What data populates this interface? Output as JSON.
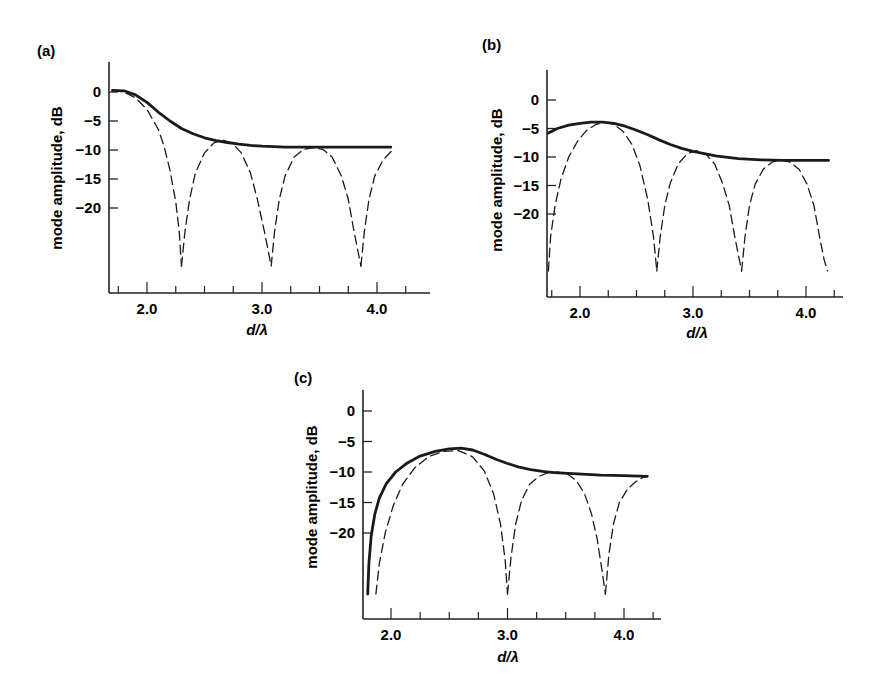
{
  "figure": {
    "panels": [
      {
        "label": "(a)",
        "ylabel": "mode amplitude, dB",
        "xlabel": "d/λ"
      },
      {
        "label": "(b)",
        "ylabel": "mode amplitude, dB",
        "xlabel": "d/λ"
      },
      {
        "label": "(c)",
        "ylabel": "mode amplitude, dB",
        "xlabel": "d/λ"
      }
    ]
  },
  "chart_data": [
    {
      "type": "line",
      "panel": "(a)",
      "title": "(a)",
      "xlabel": "d/λ",
      "ylabel": "mode amplitude, dB",
      "x_ticks": [
        2.0,
        3.0,
        4.0
      ],
      "x_tick_labels": [
        "2.0",
        "3.0",
        "4.0"
      ],
      "x_minor_step": 0.25,
      "y_ticks": [
        0,
        -5,
        -10,
        -15,
        -20
      ],
      "y_tick_labels": [
        "0",
        "-5",
        "-10",
        "-15",
        "-20"
      ],
      "xlim": [
        1.68,
        4.35
      ],
      "ylim": [
        -25,
        5
      ],
      "grid": false,
      "legend": "none",
      "series": [
        {
          "name": "envelope (solid)",
          "style": "solid",
          "x": [
            1.7,
            1.8,
            1.9,
            2.0,
            2.1,
            2.2,
            2.3,
            2.4,
            2.5,
            2.6,
            2.7,
            2.8,
            2.9,
            3.0,
            3.2,
            3.4,
            3.6,
            3.8,
            4.0,
            4.12
          ],
          "y": [
            0.3,
            0.2,
            -0.5,
            -1.8,
            -3.5,
            -5.0,
            -6.3,
            -7.2,
            -7.9,
            -8.4,
            -8.7,
            -9.0,
            -9.2,
            -9.35,
            -9.5,
            -9.5,
            -9.5,
            -9.5,
            -9.5,
            -9.5
          ]
        },
        {
          "name": "mode lobe 1 (dashed)",
          "style": "dashed",
          "x": [
            1.7,
            1.8,
            1.9,
            2.0,
            2.1,
            2.15,
            2.2,
            2.25,
            2.28,
            2.3
          ],
          "y": [
            0.3,
            0.0,
            -1.0,
            -3.0,
            -6.5,
            -9.5,
            -13.5,
            -19.0,
            -24.0,
            -30
          ]
        },
        {
          "name": "mode lobe 2 (dashed)",
          "style": "dashed",
          "x": [
            2.3,
            2.33,
            2.37,
            2.42,
            2.5,
            2.58,
            2.66,
            2.74,
            2.82,
            2.9,
            2.96,
            3.02,
            3.06,
            3.08
          ],
          "y": [
            -30,
            -24.0,
            -18.5,
            -14.0,
            -10.5,
            -8.8,
            -8.3,
            -8.8,
            -10.5,
            -14.0,
            -18.5,
            -24.0,
            -28,
            -30
          ]
        },
        {
          "name": "mode lobe 3 (dashed)",
          "style": "dashed",
          "x": [
            3.08,
            3.11,
            3.15,
            3.2,
            3.28,
            3.36,
            3.45,
            3.53,
            3.61,
            3.69,
            3.75,
            3.8,
            3.84,
            3.86
          ],
          "y": [
            -30,
            -24.0,
            -18.5,
            -14.5,
            -11.2,
            -9.9,
            -9.6,
            -9.9,
            -11.2,
            -14.5,
            -18.5,
            -24.0,
            -28,
            -30
          ]
        },
        {
          "name": "mode lobe 4 (dashed)",
          "style": "dashed",
          "x": [
            3.86,
            3.89,
            3.93,
            3.98,
            4.05,
            4.12,
            4.15
          ],
          "y": [
            -30,
            -24.0,
            -18.5,
            -14.5,
            -11.8,
            -10.3,
            -10.1
          ]
        }
      ]
    },
    {
      "type": "line",
      "panel": "(b)",
      "title": "(b)",
      "xlabel": "d/λ",
      "ylabel": "mode amplitude, dB",
      "x_ticks": [
        2.0,
        3.0,
        4.0
      ],
      "x_tick_labels": [
        "2.0",
        "3.0",
        "4.0"
      ],
      "x_minor_step": 0.25,
      "y_ticks": [
        0,
        -5,
        -10,
        -15,
        -20
      ],
      "y_tick_labels": [
        "0",
        "-5",
        "-10",
        "-15",
        "-20"
      ],
      "xlim": [
        1.72,
        4.35
      ],
      "ylim": [
        -25,
        5
      ],
      "grid": false,
      "legend": "none",
      "series": [
        {
          "name": "envelope (solid)",
          "style": "solid",
          "x": [
            1.72,
            1.8,
            1.9,
            2.0,
            2.1,
            2.2,
            2.3,
            2.4,
            2.5,
            2.6,
            2.7,
            2.8,
            2.9,
            3.0,
            3.1,
            3.2,
            3.4,
            3.6,
            3.8,
            4.0,
            4.2
          ],
          "y": [
            -5.8,
            -5.0,
            -4.4,
            -4.1,
            -3.9,
            -3.9,
            -4.1,
            -4.6,
            -5.3,
            -6.1,
            -7.0,
            -7.8,
            -8.5,
            -9.0,
            -9.4,
            -9.8,
            -10.3,
            -10.5,
            -10.6,
            -10.6,
            -10.6
          ]
        },
        {
          "name": "mode lobe 1 (dashed)",
          "style": "dashed",
          "x": [
            1.72,
            1.74,
            1.78,
            1.83,
            1.9,
            1.98,
            2.06,
            2.14,
            2.22,
            2.3,
            2.38,
            2.46,
            2.53,
            2.6,
            2.65,
            2.68
          ],
          "y": [
            -30,
            -24.0,
            -18.5,
            -14.0,
            -10.0,
            -7.2,
            -5.3,
            -4.3,
            -3.9,
            -4.3,
            -5.5,
            -7.8,
            -11.5,
            -17.5,
            -24.0,
            -30
          ]
        },
        {
          "name": "mode lobe 2 (dashed)",
          "style": "dashed",
          "x": [
            2.68,
            2.71,
            2.75,
            2.8,
            2.87,
            2.95,
            3.03,
            3.11,
            3.19,
            3.26,
            3.32,
            3.37,
            3.41,
            3.43
          ],
          "y": [
            -30,
            -24.0,
            -18.5,
            -14.5,
            -11.2,
            -9.4,
            -8.9,
            -9.4,
            -11.2,
            -14.5,
            -18.5,
            -24.0,
            -28,
            -30
          ]
        },
        {
          "name": "mode lobe 3 (dashed)",
          "style": "dashed",
          "x": [
            3.43,
            3.46,
            3.5,
            3.55,
            3.62,
            3.7,
            3.78,
            3.86,
            3.94,
            4.01,
            4.07,
            4.12,
            4.16,
            4.19
          ],
          "y": [
            -30,
            -24.0,
            -18.5,
            -14.8,
            -12.2,
            -10.9,
            -10.5,
            -10.9,
            -12.2,
            -14.8,
            -18.5,
            -24.0,
            -28,
            -30
          ]
        }
      ]
    },
    {
      "type": "line",
      "panel": "(c)",
      "title": "(c)",
      "xlabel": "d/λ",
      "ylabel": "mode amplitude, dB",
      "x_ticks": [
        2.0,
        3.0,
        4.0
      ],
      "x_tick_labels": [
        "2.0",
        "3.0",
        "4.0"
      ],
      "x_minor_step": 0.25,
      "y_ticks": [
        0,
        -5,
        -10,
        -15,
        -20
      ],
      "y_tick_labels": [
        "0",
        "-5",
        "-10",
        "-15",
        "-20"
      ],
      "xlim": [
        1.76,
        4.3
      ],
      "ylim": [
        -25,
        5
      ],
      "grid": false,
      "legend": "none",
      "series": [
        {
          "name": "envelope (solid)",
          "style": "solid",
          "x": [
            1.8,
            1.81,
            1.83,
            1.86,
            1.9,
            1.96,
            2.04,
            2.14,
            2.25,
            2.38,
            2.5,
            2.6,
            2.7,
            2.8,
            2.9,
            3.0,
            3.1,
            3.2,
            3.3,
            3.4,
            3.6,
            3.8,
            4.0,
            4.2
          ],
          "y": [
            -30,
            -25.0,
            -20.5,
            -17.0,
            -14.3,
            -11.9,
            -10.0,
            -8.5,
            -7.4,
            -6.6,
            -6.2,
            -6.1,
            -6.4,
            -7.1,
            -7.9,
            -8.6,
            -9.2,
            -9.6,
            -9.9,
            -10.1,
            -10.3,
            -10.5,
            -10.6,
            -10.7
          ]
        },
        {
          "name": "mode lobe 1 (dashed)",
          "style": "dashed",
          "x": [
            1.87,
            1.9,
            1.95,
            2.02,
            2.1,
            2.2,
            2.32,
            2.45,
            2.58,
            2.7,
            2.8,
            2.88,
            2.94,
            2.98,
            3.0
          ],
          "y": [
            -30,
            -25.0,
            -20.0,
            -15.5,
            -12.0,
            -9.4,
            -7.5,
            -6.6,
            -6.5,
            -7.5,
            -9.8,
            -13.5,
            -18.5,
            -24.5,
            -30
          ]
        },
        {
          "name": "mode lobe 2 (dashed)",
          "style": "dashed",
          "x": [
            3.0,
            3.03,
            3.07,
            3.12,
            3.19,
            3.27,
            3.35,
            3.43,
            3.51,
            3.59,
            3.66,
            3.72,
            3.77,
            3.81,
            3.84
          ],
          "y": [
            -30,
            -24.0,
            -18.5,
            -14.7,
            -12.0,
            -10.7,
            -10.1,
            -10.0,
            -10.3,
            -11.4,
            -13.5,
            -16.8,
            -21.0,
            -26.0,
            -30
          ]
        },
        {
          "name": "mode lobe 3 (dashed)",
          "style": "dashed",
          "x": [
            3.84,
            3.87,
            3.91,
            3.96,
            4.03,
            4.1,
            4.16,
            4.2
          ],
          "y": [
            -30,
            -23.5,
            -18.5,
            -15.0,
            -12.8,
            -11.6,
            -10.9,
            -10.7
          ]
        }
      ]
    }
  ]
}
